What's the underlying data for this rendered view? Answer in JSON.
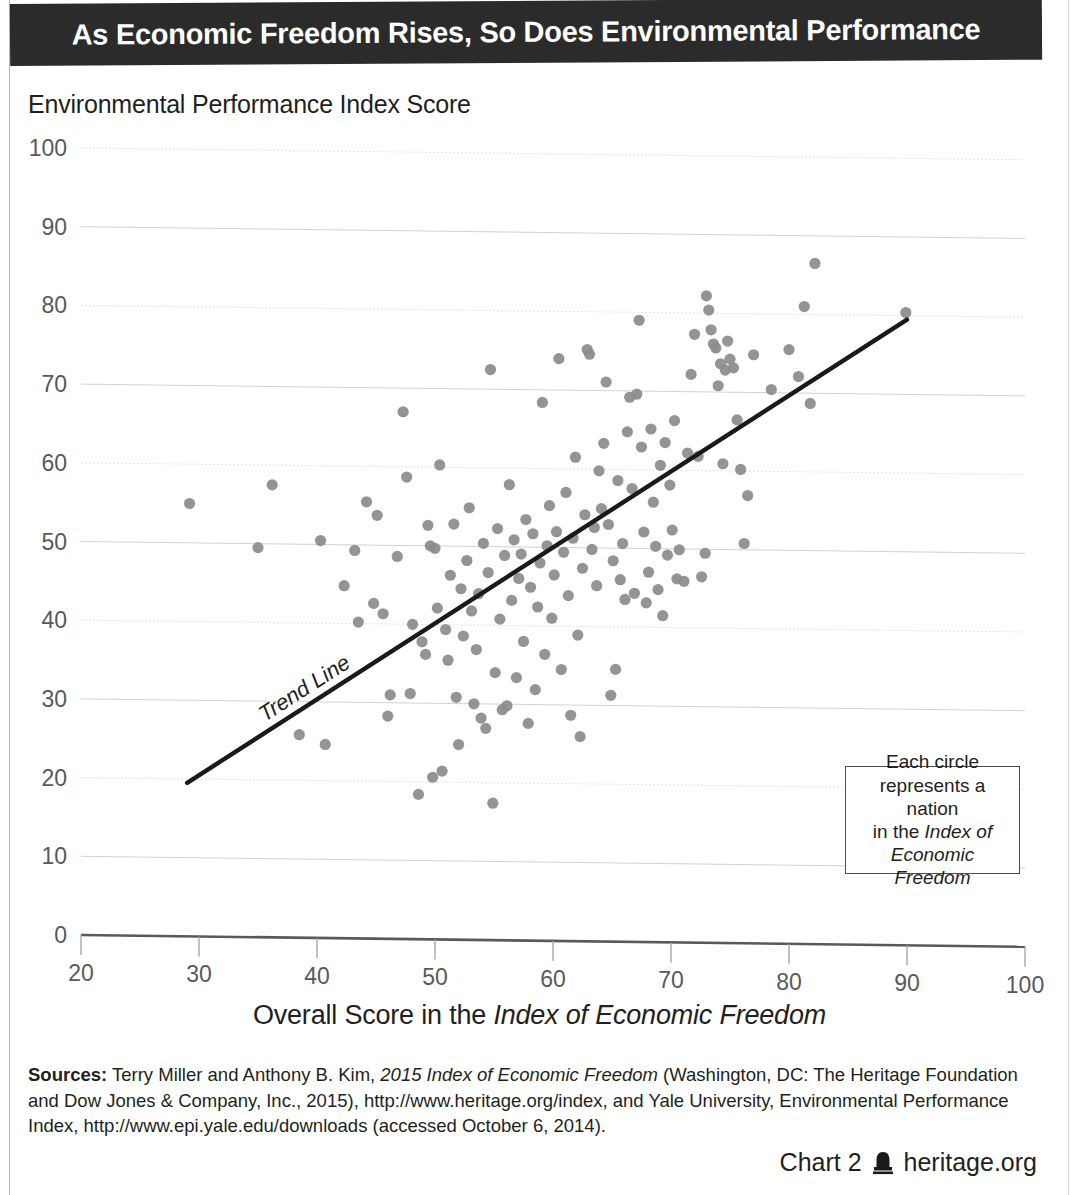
{
  "title": "As Economic Freedom Rises, So Does Environmental Performance",
  "y_axis_caption": "Environmental Performance Index Score",
  "x_axis_caption_prefix": "Overall Score in the ",
  "x_axis_caption_italic": "Index of Economic Freedom",
  "legend_note": {
    "line1": "Each circle",
    "line2": "represents a nation",
    "line3_prefix": "in the ",
    "line3_italic": "Index of",
    "line4_italic": "Economic Freedom"
  },
  "trend_label": "Trend Line",
  "sources": {
    "label": "Sources:",
    "text_1": " Terry Miller and Anthony B. Kim, ",
    "italic_1": "2015 Index of Economic Freedom",
    "text_2": " (Washington, DC: The Heritage Foundation and Dow Jones & Company, Inc., 2015), http://www.heritage.org/index, and Yale University, Environmental Performance Index, http://www.epi.yale.edu/downloads (accessed October 6, 2014)."
  },
  "footer": {
    "chart_number": "Chart 2",
    "site": "heritage.org",
    "logo_name": "heritage-bell-logo"
  },
  "colors": {
    "banner_bg": "#2b2b2b",
    "banner_text": "#ffffff",
    "point": "#8b8b8b",
    "trendline": "#1a1a1a",
    "gridline": "#d2d2d2",
    "axis": "#58595b",
    "tick_text": "#58595b"
  },
  "chart_data": {
    "type": "scatter",
    "title": "As Economic Freedom Rises, So Does Environmental Performance",
    "xlabel": "Overall Score in the Index of Economic Freedom",
    "ylabel": "Environmental Performance Index Score",
    "xlim": [
      20,
      100
    ],
    "ylim": [
      0,
      100
    ],
    "xticks": [
      20,
      30,
      40,
      50,
      60,
      70,
      80,
      90,
      100
    ],
    "yticks": [
      0,
      10,
      20,
      30,
      40,
      50,
      60,
      70,
      80,
      90,
      100
    ],
    "grid": true,
    "legend": "Each circle represents a nation in the Index of Economic Freedom",
    "legend_position": "inside-lower-right",
    "trendline": {
      "label": "Trend Line",
      "x_start": 29.0,
      "y_start": 19.5,
      "x_end": 90.0,
      "y_end": 79.5,
      "slope": 0.984,
      "intercept": -9.03
    },
    "points": [
      [
        29.2,
        55.0
      ],
      [
        35.0,
        49.5
      ],
      [
        36.2,
        57.5
      ],
      [
        38.5,
        25.8
      ],
      [
        40.3,
        50.5
      ],
      [
        40.7,
        24.6
      ],
      [
        42.3,
        44.8
      ],
      [
        43.2,
        49.3
      ],
      [
        43.5,
        40.2
      ],
      [
        44.2,
        55.5
      ],
      [
        44.8,
        42.6
      ],
      [
        45.1,
        53.8
      ],
      [
        45.6,
        41.3
      ],
      [
        46.0,
        28.3
      ],
      [
        46.2,
        31.0
      ],
      [
        46.8,
        48.6
      ],
      [
        47.3,
        67.0
      ],
      [
        47.6,
        58.7
      ],
      [
        47.9,
        31.2
      ],
      [
        48.1,
        40.0
      ],
      [
        48.6,
        18.4
      ],
      [
        48.9,
        37.8
      ],
      [
        49.2,
        36.2
      ],
      [
        49.4,
        52.6
      ],
      [
        49.6,
        50.0
      ],
      [
        49.8,
        20.6
      ],
      [
        50.0,
        49.7
      ],
      [
        50.2,
        42.1
      ],
      [
        50.4,
        60.3
      ],
      [
        50.6,
        21.4
      ],
      [
        50.9,
        39.4
      ],
      [
        51.1,
        35.5
      ],
      [
        51.3,
        46.3
      ],
      [
        51.6,
        52.8
      ],
      [
        51.8,
        30.8
      ],
      [
        52.0,
        24.8
      ],
      [
        52.2,
        44.6
      ],
      [
        52.4,
        38.6
      ],
      [
        52.7,
        48.2
      ],
      [
        52.9,
        54.9
      ],
      [
        53.1,
        41.8
      ],
      [
        53.3,
        30.0
      ],
      [
        53.5,
        36.9
      ],
      [
        53.7,
        44.0
      ],
      [
        53.9,
        28.2
      ],
      [
        54.1,
        50.4
      ],
      [
        54.3,
        26.9
      ],
      [
        54.5,
        46.7
      ],
      [
        54.7,
        72.5
      ],
      [
        54.9,
        17.4
      ],
      [
        55.1,
        34.0
      ],
      [
        55.3,
        52.3
      ],
      [
        55.5,
        40.8
      ],
      [
        55.7,
        29.3
      ],
      [
        55.9,
        48.9
      ],
      [
        56.1,
        29.8
      ],
      [
        56.3,
        57.9
      ],
      [
        56.5,
        43.2
      ],
      [
        56.7,
        50.9
      ],
      [
        56.9,
        33.4
      ],
      [
        57.1,
        46.0
      ],
      [
        57.3,
        49.1
      ],
      [
        57.5,
        38.0
      ],
      [
        57.7,
        53.5
      ],
      [
        57.9,
        27.6
      ],
      [
        58.1,
        44.9
      ],
      [
        58.3,
        51.7
      ],
      [
        58.5,
        31.9
      ],
      [
        58.7,
        42.4
      ],
      [
        58.9,
        48.0
      ],
      [
        59.1,
        68.4
      ],
      [
        59.3,
        36.4
      ],
      [
        59.5,
        50.2
      ],
      [
        59.7,
        55.3
      ],
      [
        59.9,
        41.0
      ],
      [
        60.1,
        46.5
      ],
      [
        60.3,
        52.0
      ],
      [
        60.5,
        74.0
      ],
      [
        60.7,
        34.5
      ],
      [
        60.9,
        49.4
      ],
      [
        61.1,
        57.0
      ],
      [
        61.3,
        43.9
      ],
      [
        61.5,
        28.7
      ],
      [
        61.7,
        51.2
      ],
      [
        61.9,
        61.5
      ],
      [
        62.1,
        38.9
      ],
      [
        62.3,
        26.0
      ],
      [
        62.5,
        47.4
      ],
      [
        62.7,
        54.2
      ],
      [
        62.9,
        75.2
      ],
      [
        63.1,
        74.6
      ],
      [
        63.3,
        49.8
      ],
      [
        63.5,
        52.6
      ],
      [
        63.7,
        45.2
      ],
      [
        63.9,
        59.8
      ],
      [
        64.1,
        55.0
      ],
      [
        64.3,
        63.3
      ],
      [
        64.5,
        71.1
      ],
      [
        64.7,
        53.0
      ],
      [
        64.9,
        31.3
      ],
      [
        65.1,
        48.4
      ],
      [
        65.3,
        34.6
      ],
      [
        65.5,
        58.6
      ],
      [
        65.7,
        46.0
      ],
      [
        65.9,
        50.6
      ],
      [
        66.1,
        43.5
      ],
      [
        66.3,
        64.8
      ],
      [
        66.5,
        69.2
      ],
      [
        66.7,
        57.6
      ],
      [
        66.9,
        44.3
      ],
      [
        67.1,
        69.6
      ],
      [
        67.3,
        79.0
      ],
      [
        67.5,
        62.9
      ],
      [
        67.7,
        52.1
      ],
      [
        67.9,
        43.1
      ],
      [
        68.1,
        47.0
      ],
      [
        68.3,
        65.2
      ],
      [
        68.5,
        55.9
      ],
      [
        68.7,
        50.3
      ],
      [
        68.9,
        44.8
      ],
      [
        69.1,
        60.6
      ],
      [
        69.3,
        41.5
      ],
      [
        69.5,
        63.5
      ],
      [
        69.7,
        49.2
      ],
      [
        69.9,
        58.1
      ],
      [
        70.1,
        52.4
      ],
      [
        70.3,
        66.3
      ],
      [
        70.5,
        46.2
      ],
      [
        70.7,
        49.9
      ],
      [
        71.1,
        45.9
      ],
      [
        71.4,
        62.2
      ],
      [
        71.7,
        72.2
      ],
      [
        72.0,
        77.3
      ],
      [
        72.3,
        61.8
      ],
      [
        72.6,
        46.5
      ],
      [
        72.9,
        49.5
      ],
      [
        73.0,
        82.2
      ],
      [
        73.2,
        80.4
      ],
      [
        73.4,
        77.9
      ],
      [
        73.6,
        76.1
      ],
      [
        73.8,
        75.6
      ],
      [
        74.0,
        70.8
      ],
      [
        74.2,
        73.6
      ],
      [
        74.4,
        60.9
      ],
      [
        74.6,
        72.8
      ],
      [
        74.8,
        76.5
      ],
      [
        75.0,
        74.2
      ],
      [
        75.3,
        73.1
      ],
      [
        75.6,
        66.5
      ],
      [
        75.9,
        60.2
      ],
      [
        76.2,
        50.8
      ],
      [
        76.5,
        56.9
      ],
      [
        77.0,
        74.8
      ],
      [
        78.5,
        70.4
      ],
      [
        80.0,
        75.5
      ],
      [
        80.8,
        72.1
      ],
      [
        81.3,
        81.0
      ],
      [
        81.8,
        68.7
      ],
      [
        82.2,
        86.5
      ],
      [
        89.9,
        80.4
      ]
    ]
  }
}
